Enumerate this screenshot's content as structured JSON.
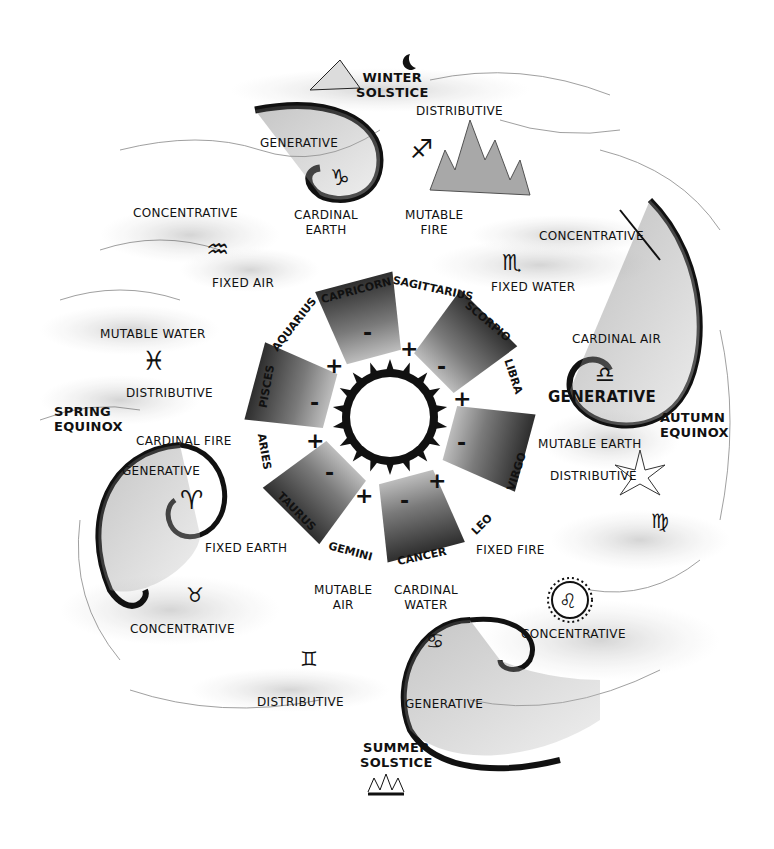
{
  "diagram": {
    "title": "",
    "center": {
      "sun": "sun-circle",
      "segments": [
        {
          "position": "capricorn",
          "polarity": "-"
        },
        {
          "position": "scorpio",
          "polarity": "-"
        },
        {
          "position": "virgo",
          "polarity": "-"
        },
        {
          "position": "cancer",
          "polarity": "-"
        },
        {
          "position": "taurus",
          "polarity": "-"
        },
        {
          "position": "pisces",
          "polarity": "-"
        }
      ],
      "plus_signs": [
        "+",
        "+",
        "+",
        "+",
        "+",
        "+"
      ]
    },
    "zodiac_ring": {
      "aquarius": "AQUARIUS",
      "capricorn": "CAPRICORN",
      "sagittarius": "SAGITTARIUS",
      "scorpio": "SCORPIO",
      "libra": "LIBRA",
      "virgo": "VIRGO",
      "leo": "LEO",
      "cancer": "CANCER",
      "gemini": "GEMINI",
      "taurus": "TAURUS",
      "aries": "ARIES",
      "pisces": "PISCES"
    },
    "seasons": {
      "winter": [
        "WINTER",
        "SOLSTICE"
      ],
      "summer": [
        "SUMMER",
        "SOLSTICE"
      ],
      "spring": [
        "SPRING",
        "EQUINOX"
      ],
      "autumn": [
        "AUTUMN",
        "EQUINOX"
      ]
    },
    "qualities": {
      "cardinal_earth": [
        "CARDINAL",
        "EARTH"
      ],
      "mutable_fire": [
        "MUTABLE",
        "FIRE"
      ],
      "fixed_air": "FIXED AIR",
      "mutable_water": "MUTABLE WATER",
      "cardinal_fire": "CARDINAL FIRE",
      "fixed_earth": "FIXED EARTH",
      "mutable_air": [
        "MUTABLE",
        "AIR"
      ],
      "cardinal_water": [
        "CARDINAL",
        "WATER"
      ],
      "fixed_fire": "FIXED FIRE",
      "mutable_earth": "MUTABLE EARTH",
      "cardinal_air": "CARDINAL AIR",
      "fixed_water": "FIXED WATER"
    },
    "modes": {
      "generative_capricorn": "GENERATIVE",
      "distributive_sagittarius": "DISTRIBUTIVE",
      "concentrative_aquarius": "CONCENTRATIVE",
      "distributive_pisces": "DISTRIBUTIVE",
      "generative_aries": "GENERATIVE",
      "concentrative_taurus": "CONCENTRATIVE",
      "distributive_gemini": "DISTRIBUTIVE",
      "generative_cancer": "GENERATIVE",
      "concentrative_leo": "CONCENTRATIVE",
      "distributive_virgo": "DISTRIBUTIVE",
      "generative_libra": "GENERATIVE",
      "concentrative_scorpio": "CONCENTRATIVE"
    },
    "glyphs": {
      "capricorn": "♑",
      "sagittarius": "♐",
      "aquarius": "♒",
      "pisces": "♓",
      "aries": "♈",
      "taurus": "♉",
      "gemini": "♊",
      "cancer": "♋",
      "leo": "♌",
      "virgo": "♍",
      "libra": "♎",
      "scorpio": "♏"
    },
    "colors": {
      "ink": "#111111",
      "wash_dark": "#3a3a3a",
      "wash_mid": "#8a8a8a",
      "wash_light": "#d4d4d4",
      "paper": "#ffffff"
    }
  }
}
